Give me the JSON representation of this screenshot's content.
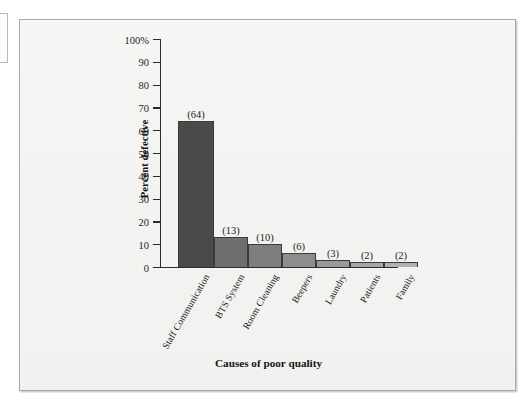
{
  "chart_data": {
    "type": "bar",
    "title": "",
    "xlabel": "Causes of poor quality",
    "ylabel": "Percent defective",
    "categories": [
      "Staff Communication",
      "BTS System",
      "Room Cleaning",
      "Beepers",
      "Laundry",
      "Patients",
      "Family"
    ],
    "values": [
      64,
      13,
      10,
      6,
      3,
      2,
      2
    ],
    "data_labels": [
      "(64)",
      "(13)",
      "(10)",
      "(6)",
      "(3)",
      "(2)",
      "(2)"
    ],
    "bar_colors": [
      "#4a4a4a",
      "#6f6f6f",
      "#7e7e7e",
      "#8d8d8d",
      "#9a9a9a",
      "#a6a6a6",
      "#b0b0b0"
    ],
    "ylim": [
      0,
      100
    ],
    "ytick_labels": [
      "100%",
      "90",
      "80",
      "70",
      "60",
      "50",
      "40",
      "30",
      "20",
      "10",
      "0"
    ],
    "ytick_values": [
      100,
      90,
      80,
      70,
      60,
      50,
      40,
      30,
      20,
      10,
      0
    ],
    "grid": false,
    "legend": false
  },
  "figure": {
    "background_color": "#f4f4f2",
    "border_color": "#a8a8a8",
    "axis_color": "#2c2c2c"
  }
}
